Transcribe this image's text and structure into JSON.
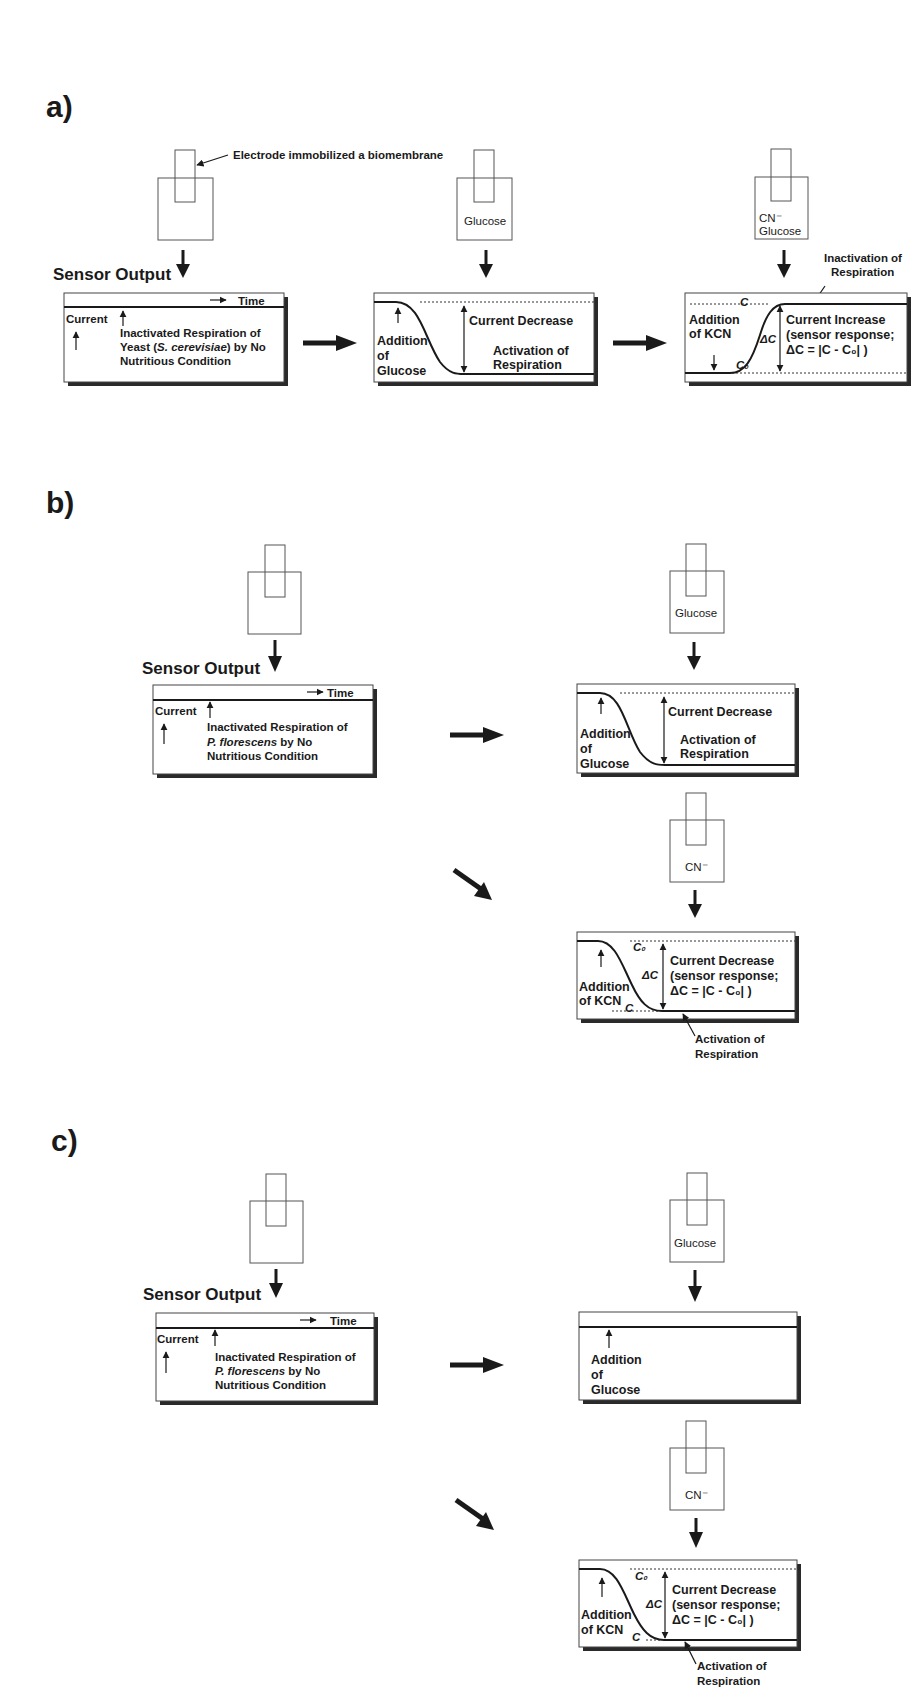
{
  "figure": {
    "panels": [
      {
        "label": "a)",
        "electrode_callout": "Electrode immobilized a biomembrane",
        "sensor_output": "Sensor Output",
        "step1": {
          "time": "Time",
          "current": "Current",
          "desc_line1": "Inactivated Respiration of",
          "desc_line2_pre": "Yeast (",
          "desc_line2_it": "S. cerevisiae",
          "desc_line2_post": ") by No",
          "desc_line3": "Nutritious Condition"
        },
        "step2": {
          "vessel_label": "Glucose",
          "addition_l1": "Addition",
          "addition_l2": "of",
          "addition_l3": "Glucose",
          "change": "Current Decrease",
          "activation_l1": "Activation of",
          "activation_l2": "Respiration"
        },
        "step3": {
          "vessel_label_l1": "CN⁻",
          "vessel_label_l2": "Glucose",
          "inactivation_l1": "Inactivation of",
          "inactivation_l2": "Respiration",
          "addition_l1": "Addition",
          "addition_l2": "of KCN",
          "c_label": "C",
          "c0_label": "C₀",
          "delta_c": "ΔC",
          "change_l1": "Current Increase",
          "change_l2": "(sensor response;",
          "change_l3": "ΔC = |C - C₀| )"
        }
      },
      {
        "label": "b)",
        "sensor_output": "Sensor Output",
        "step1": {
          "time": "Time",
          "current": "Current",
          "desc_line1": "Inactivated Respiration of",
          "desc_line2_it": "P. florescens",
          "desc_line2_post": " by No",
          "desc_line3": "Nutritious Condition"
        },
        "step2": {
          "vessel_label": "Glucose",
          "addition_l1": "Addition",
          "addition_l2": "of",
          "addition_l3": "Glucose",
          "change": "Current Decrease",
          "activation_l1": "Activation of",
          "activation_l2": "Respiration"
        },
        "step3": {
          "vessel_label": "CN⁻",
          "addition_l1": "Addition",
          "addition_l2": "of KCN",
          "c_label": "C",
          "c0_label": "C₀",
          "delta_c": "ΔC",
          "change_l1": "Current Decrease",
          "change_l2": "(sensor response;",
          "change_l3": "ΔC = |C - C₀| )",
          "activation_l1": "Activation of",
          "activation_l2": "Respiration"
        }
      },
      {
        "label": "c)",
        "sensor_output": "Sensor Output",
        "step1": {
          "time": "Time",
          "current": "Current",
          "desc_line1": "Inactivated Respiration of",
          "desc_line2_it": "P. florescens",
          "desc_line2_post": " by No",
          "desc_line3": "Nutritious Condition"
        },
        "step2": {
          "vessel_label": "Glucose",
          "addition_l1": "Addition",
          "addition_l2": "of",
          "addition_l3": "Glucose"
        },
        "step3": {
          "vessel_label": "CN⁻",
          "addition_l1": "Addition",
          "addition_l2": "of KCN",
          "c_label": "C",
          "c0_label": "C₀",
          "delta_c": "ΔC",
          "change_l1": "Current Decrease",
          "change_l2": "(sensor response;",
          "change_l3": "ΔC = |C - C₀| )",
          "activation_l1": "Activation of",
          "activation_l2": "Respiration"
        }
      }
    ]
  }
}
